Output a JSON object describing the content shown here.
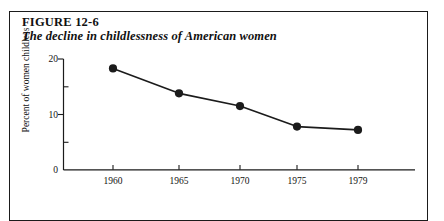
{
  "figure": {
    "label": "FIGURE 12-6",
    "caption": "The decline in childlessness of American women"
  },
  "chart_data": {
    "type": "line",
    "title": "The decline in childlessness of American women",
    "xlabel": "",
    "ylabel": "Percent of women childless",
    "categories": [
      "1960",
      "1965",
      "1970",
      "1975",
      "1979"
    ],
    "values": [
      18.3,
      13.8,
      11.5,
      7.8,
      7.2
    ],
    "ylim": [
      0,
      20
    ],
    "y_major_ticks": [
      "0",
      "10",
      "20"
    ],
    "y_major_tick_values": [
      0,
      10,
      20
    ],
    "y_minor_tick_values": [
      5,
      15
    ],
    "grid": false,
    "legend": false,
    "marker": "filled-circle",
    "line_color": "#1b1b1b",
    "marker_color": "#1b1b1b",
    "axis_color": "#1b1b1b",
    "background": "#ffffff"
  },
  "axis_labels": {
    "y": [
      "0",
      "10",
      "20"
    ],
    "x": [
      "1960",
      "1965",
      "1970",
      "1975",
      "1979"
    ]
  }
}
